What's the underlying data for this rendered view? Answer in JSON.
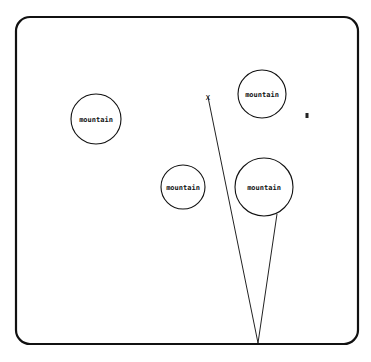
{
  "frame": {
    "x": 16,
    "y": 17,
    "width": 342,
    "height": 327,
    "radius": 14
  },
  "mountains": [
    {
      "label": "mountain",
      "cx": 96,
      "cy": 119,
      "r": 25
    },
    {
      "label": "mountain",
      "cx": 262,
      "cy": 94,
      "r": 24
    },
    {
      "label": "mountain",
      "cx": 183,
      "cy": 187,
      "r": 22
    },
    {
      "label": "mountain",
      "cx": 264,
      "cy": 187,
      "r": 29
    }
  ],
  "target_marker": {
    "symbol": "x",
    "x": 208,
    "y": 97
  },
  "agent_marker": {
    "symbol": "▮",
    "x": 307,
    "y": 116
  },
  "viewpoint": {
    "x": 258,
    "y": 343
  },
  "rays": [
    {
      "x1": 258,
      "y1": 343,
      "x2": 208,
      "y2": 97
    },
    {
      "x1": 258,
      "y1": 343,
      "x2": 277,
      "y2": 214
    }
  ]
}
